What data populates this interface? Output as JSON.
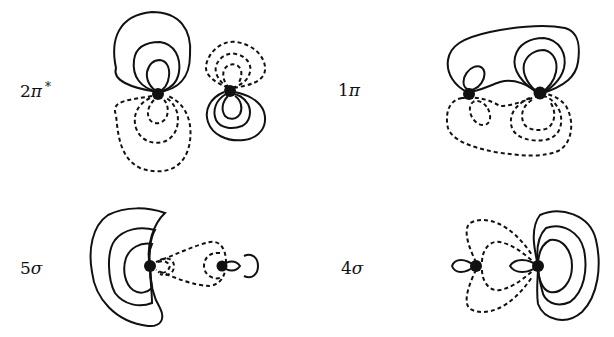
{
  "panels": [
    {
      "id": "2pi-star",
      "label_num": "2",
      "label_sym": "π",
      "label_sup": "*",
      "position": "top-left"
    },
    {
      "id": "1pi",
      "label_num": "1",
      "label_sym": "π",
      "label_sup": "",
      "position": "top-right"
    },
    {
      "id": "5sigma",
      "label_num": "5",
      "label_sym": "σ",
      "label_sup": "",
      "position": "bottom-left"
    },
    {
      "id": "4sigma",
      "label_num": "4",
      "label_sym": "σ",
      "label_sup": "",
      "position": "bottom-right"
    }
  ],
  "legend_meaning": {
    "solid": "positive phase contour",
    "dashed": "negative phase contour",
    "dots": "nuclei"
  }
}
